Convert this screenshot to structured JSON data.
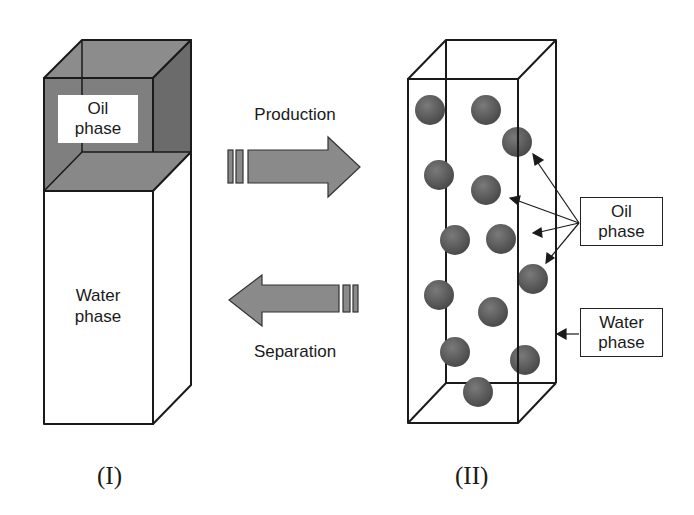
{
  "panels": {
    "left": {
      "caption": "(I)",
      "oil_label": [
        "Oil",
        "phase"
      ],
      "water_label": [
        "Water",
        "phase"
      ]
    },
    "right": {
      "caption": "(II)",
      "oil_label": [
        "Oil",
        "phase"
      ],
      "water_label": [
        "Water",
        "phase"
      ],
      "droplet_count": 14
    }
  },
  "arrows": {
    "forward": {
      "label": "Production",
      "direction": "right"
    },
    "backward": {
      "label": "Separation",
      "direction": "left"
    }
  },
  "colors": {
    "oil_top": "#8c8c8c",
    "oil_front": "#7f7f7f",
    "oil_side": "#6b6b6b",
    "arrow_fill": "#8a8a8a",
    "droplet": "#5a5a5a",
    "line": "#1a1a1a"
  }
}
